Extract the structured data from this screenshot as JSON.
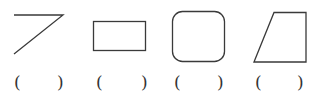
{
  "colors": {
    "stroke": "#3a3a3a",
    "background": "#ffffff"
  },
  "shapes": [
    {
      "name": "angle-line-shape",
      "type": "polyline"
    },
    {
      "name": "rectangle-shape",
      "type": "rect"
    },
    {
      "name": "rounded-square-shape",
      "type": "rounded-rect"
    },
    {
      "name": "trapezoid-shape",
      "type": "polygon"
    }
  ],
  "answers": [
    {
      "open": "(",
      "close": ")",
      "value": ""
    },
    {
      "open": "(",
      "close": ")",
      "value": ""
    },
    {
      "open": "(",
      "close": ")",
      "value": ""
    },
    {
      "open": "(",
      "close": ")",
      "value": ""
    }
  ]
}
